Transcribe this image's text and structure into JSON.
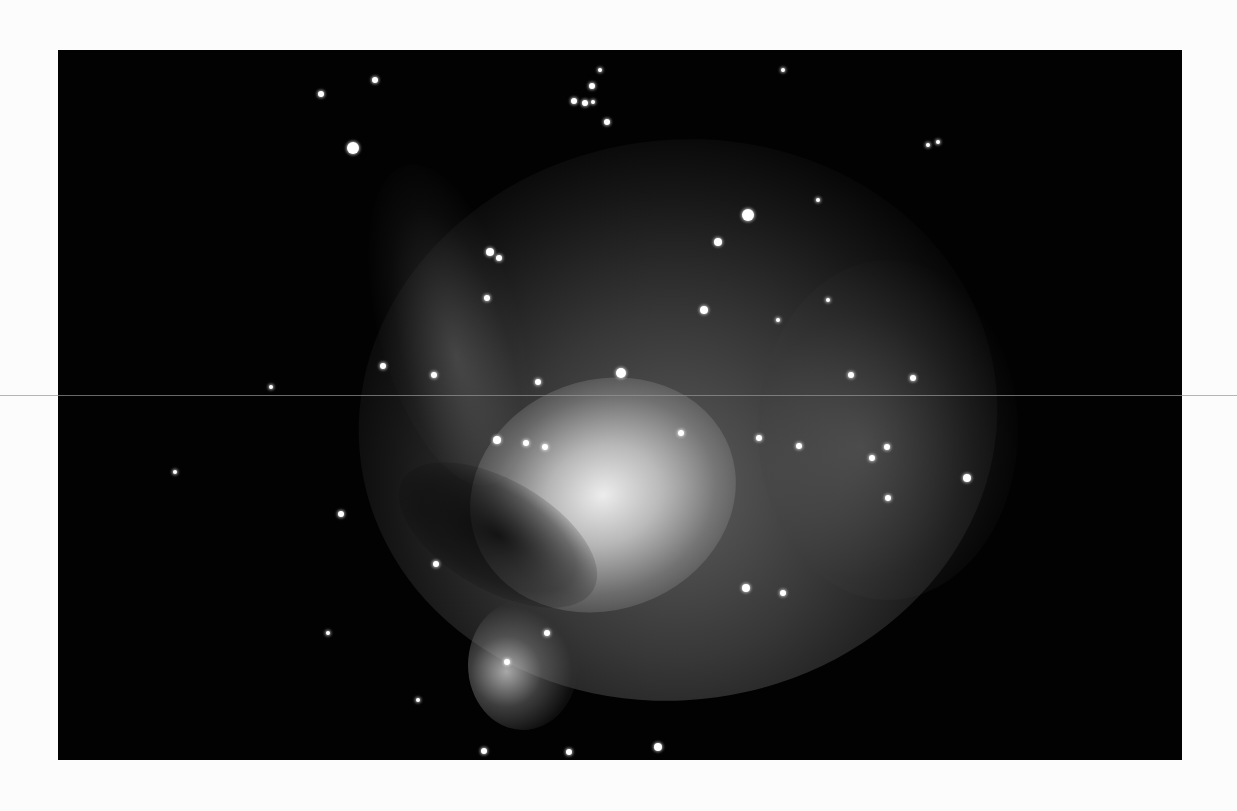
{
  "image": {
    "subject": "Orion Nebula astrophotograph (black and white print)",
    "frame": {
      "left": 58,
      "top": 50,
      "width": 1124,
      "height": 710,
      "background": "#020202"
    },
    "paper_color": "#fcfcfc",
    "scanline_y": 395,
    "caption_bleed": ""
  },
  "stars": [
    {
      "x": 295,
      "y": 98,
      "r": 6
    },
    {
      "x": 263,
      "y": 44,
      "r": 3
    },
    {
      "x": 317,
      "y": 30,
      "r": 3
    },
    {
      "x": 516,
      "y": 51,
      "r": 3
    },
    {
      "x": 527,
      "y": 53,
      "r": 3
    },
    {
      "x": 535,
      "y": 52,
      "r": 2
    },
    {
      "x": 534,
      "y": 36,
      "r": 3
    },
    {
      "x": 549,
      "y": 72,
      "r": 3
    },
    {
      "x": 542,
      "y": 20,
      "r": 2
    },
    {
      "x": 690,
      "y": 165,
      "r": 6
    },
    {
      "x": 660,
      "y": 192,
      "r": 4
    },
    {
      "x": 432,
      "y": 202,
      "r": 4
    },
    {
      "x": 441,
      "y": 208,
      "r": 3
    },
    {
      "x": 429,
      "y": 248,
      "r": 3
    },
    {
      "x": 646,
      "y": 260,
      "r": 4
    },
    {
      "x": 563,
      "y": 323,
      "r": 5
    },
    {
      "x": 480,
      "y": 332,
      "r": 3
    },
    {
      "x": 376,
      "y": 325,
      "r": 3
    },
    {
      "x": 325,
      "y": 316,
      "r": 3
    },
    {
      "x": 439,
      "y": 390,
      "r": 4
    },
    {
      "x": 468,
      "y": 393,
      "r": 3
    },
    {
      "x": 487,
      "y": 397,
      "r": 3
    },
    {
      "x": 623,
      "y": 383,
      "r": 3
    },
    {
      "x": 701,
      "y": 388,
      "r": 3
    },
    {
      "x": 741,
      "y": 396,
      "r": 3
    },
    {
      "x": 793,
      "y": 325,
      "r": 3
    },
    {
      "x": 855,
      "y": 328,
      "r": 3
    },
    {
      "x": 814,
      "y": 408,
      "r": 3
    },
    {
      "x": 829,
      "y": 397,
      "r": 3
    },
    {
      "x": 830,
      "y": 448,
      "r": 3
    },
    {
      "x": 909,
      "y": 428,
      "r": 4
    },
    {
      "x": 283,
      "y": 464,
      "r": 3
    },
    {
      "x": 378,
      "y": 514,
      "r": 3
    },
    {
      "x": 688,
      "y": 538,
      "r": 4
    },
    {
      "x": 725,
      "y": 543,
      "r": 3
    },
    {
      "x": 449,
      "y": 612,
      "r": 3
    },
    {
      "x": 489,
      "y": 583,
      "r": 3
    },
    {
      "x": 600,
      "y": 697,
      "r": 4
    },
    {
      "x": 426,
      "y": 701,
      "r": 3
    },
    {
      "x": 511,
      "y": 702,
      "r": 3
    },
    {
      "x": 117,
      "y": 422,
      "r": 2
    },
    {
      "x": 213,
      "y": 337,
      "r": 2
    },
    {
      "x": 725,
      "y": 20,
      "r": 2
    },
    {
      "x": 870,
      "y": 95,
      "r": 2
    },
    {
      "x": 880,
      "y": 92,
      "r": 2
    },
    {
      "x": 760,
      "y": 150,
      "r": 2
    },
    {
      "x": 270,
      "y": 583,
      "r": 2
    },
    {
      "x": 360,
      "y": 650,
      "r": 2
    },
    {
      "x": 720,
      "y": 270,
      "r": 2
    },
    {
      "x": 770,
      "y": 250,
      "r": 2
    }
  ]
}
